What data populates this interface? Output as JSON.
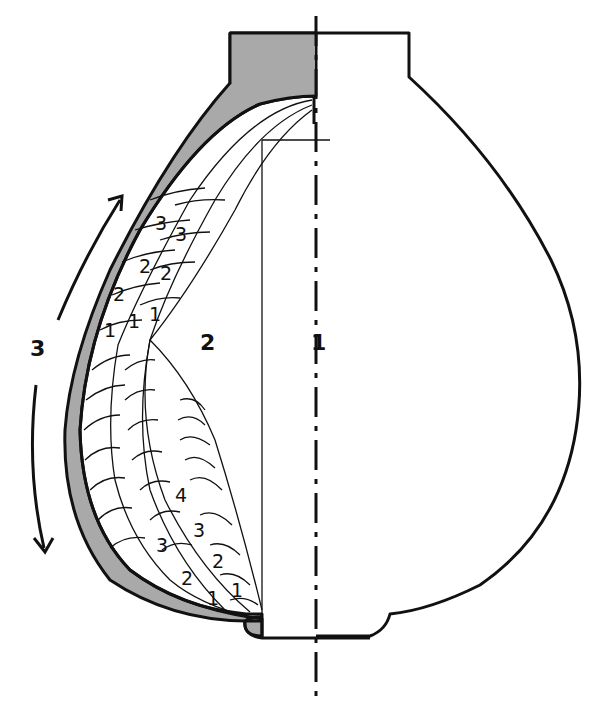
{
  "diagram": {
    "colors": {
      "ink": "#111111",
      "wall_fill": "#a9a9a9",
      "background": "#ffffff"
    },
    "region_labels": {
      "axis_region": "1",
      "inner_cavity": "2",
      "rotation_label": "3"
    },
    "layer_labels_upper_outer": [
      "3",
      "2",
      "1"
    ],
    "layer_labels_upper_inner": [
      "3",
      "2",
      "1"
    ],
    "layer_labels_lower_inner": [
      "4",
      "3",
      "2",
      "1"
    ],
    "layer_labels_lower_outer": [
      "3",
      "2",
      "1"
    ],
    "arrows": [
      {
        "name": "arrow-up",
        "direction": "up"
      },
      {
        "name": "arrow-down",
        "direction": "down"
      }
    ]
  }
}
